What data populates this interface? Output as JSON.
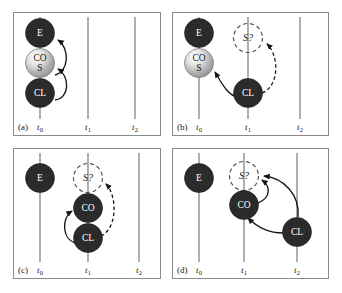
{
  "figure": {
    "background_color": "#ffffff",
    "frame_color": "#8a8a8a",
    "timeline_color": "#6e6e6e",
    "node_dark_color": "#2b2b2b",
    "node_dashed_color": "#555555",
    "arrow_color": "#161616"
  },
  "timeline_ticks": {
    "t0": "t",
    "t0_sub": "0",
    "t1": "t",
    "t1_sub": "1",
    "t2": "t",
    "t2_sub": "2"
  },
  "panels": [
    {
      "tag": "(a)",
      "ticks": [
        "t0",
        "t1",
        "t2"
      ],
      "nodes": [
        {
          "id": "a-E",
          "label": "E",
          "style": "dark",
          "timeline": "t0"
        },
        {
          "id": "a-COS",
          "label": "CO",
          "label2": "S",
          "style": "gradient",
          "timeline": "t0"
        },
        {
          "id": "a-CL",
          "label": "CL",
          "style": "dark",
          "timeline": "t0"
        }
      ],
      "edges": [
        {
          "from": "a-COS",
          "to": "a-E",
          "style": "solid"
        },
        {
          "from": "a-CL",
          "to": "a-COS",
          "style": "solid"
        }
      ]
    },
    {
      "tag": "(b)",
      "ticks": [
        "t0",
        "t1",
        "t2"
      ],
      "nodes": [
        {
          "id": "b-E",
          "label": "E",
          "style": "dark",
          "timeline": "t0"
        },
        {
          "id": "b-COS",
          "label": "CO",
          "label2": "S",
          "style": "gradient",
          "timeline": "t0"
        },
        {
          "id": "b-S",
          "label": "S?",
          "style": "dashed",
          "timeline": "t1"
        },
        {
          "id": "b-CL",
          "label": "CL",
          "style": "dark",
          "timeline": "t1"
        }
      ],
      "edges": [
        {
          "from": "b-CL",
          "to": "b-COS",
          "style": "solid"
        },
        {
          "from": "b-CL",
          "to": "b-S",
          "style": "dashed"
        }
      ]
    },
    {
      "tag": "(c)",
      "ticks": [
        "t0",
        "t1",
        "t2"
      ],
      "nodes": [
        {
          "id": "c-E",
          "label": "E",
          "style": "dark",
          "timeline": "t0"
        },
        {
          "id": "c-S",
          "label": "S?",
          "style": "dashed",
          "timeline": "t1"
        },
        {
          "id": "c-CO",
          "label": "CO",
          "style": "dark",
          "timeline": "t1"
        },
        {
          "id": "c-CL",
          "label": "CL",
          "style": "dark",
          "timeline": "t1"
        }
      ],
      "edges": [
        {
          "from": "c-CL",
          "to": "c-CO",
          "style": "solid"
        },
        {
          "from": "c-CL",
          "to": "c-S",
          "style": "dashed"
        }
      ]
    },
    {
      "tag": "(d)",
      "ticks": [
        "t0",
        "t1",
        "t2"
      ],
      "nodes": [
        {
          "id": "d-E",
          "label": "E",
          "style": "dark",
          "timeline": "t0"
        },
        {
          "id": "d-S",
          "label": "S?",
          "style": "dashed",
          "timeline": "t1"
        },
        {
          "id": "d-CO",
          "label": "CO",
          "style": "dark",
          "timeline": "t1"
        },
        {
          "id": "d-CL",
          "label": "CL",
          "style": "dark",
          "timeline": "t2"
        }
      ],
      "edges": [
        {
          "from": "d-CO",
          "to": "d-S",
          "style": "solid"
        },
        {
          "from": "d-CL",
          "to": "d-S",
          "style": "solid"
        },
        {
          "from": "d-CL",
          "to": "d-CO",
          "style": "solid"
        }
      ]
    }
  ]
}
